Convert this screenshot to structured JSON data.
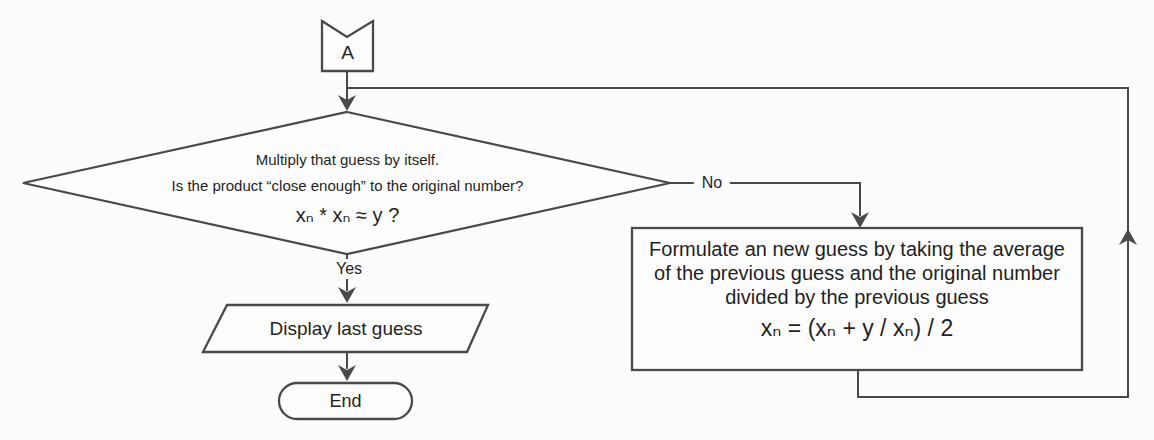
{
  "colors": {
    "background": "#fcfcfc",
    "line": "#494949",
    "arrow": "#4a4a4a",
    "text": "#1f1f1f"
  },
  "flowchart": {
    "connector_a": {
      "label": "A"
    },
    "decision": {
      "line1": "Multiply that guess by itself.",
      "line2": "Is the product “close enough” to the original number?",
      "formula": "xₙ * xₙ ≈ y ?"
    },
    "edges": {
      "no": "No",
      "yes": "Yes"
    },
    "process": {
      "line1": "Formulate an new guess by taking the average",
      "line2": "of the previous guess and the original number",
      "line3": "divided by the previous guess",
      "formula": "xₙ = (xₙ + y / xₙ) / 2"
    },
    "output": {
      "label": "Display last guess"
    },
    "terminator": {
      "label": "End"
    }
  }
}
